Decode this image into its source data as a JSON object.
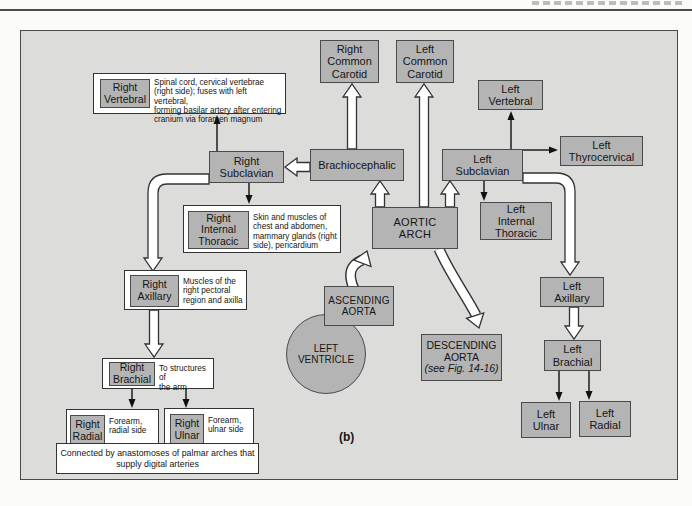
{
  "figure": {
    "caption": "(b)"
  },
  "colors": {
    "box_fill": "#b4b4b4",
    "box_border": "#4a4a4a",
    "frame_background": "#dcdcda",
    "description_box_background": "#ffffff",
    "text": "#151515"
  },
  "nodes": {
    "right_common_carotid": {
      "label": "Right\nCommon\nCarotid"
    },
    "left_common_carotid": {
      "label": "Left\nCommon\nCarotid"
    },
    "left_vertebral": {
      "label": "Left\nVertebral"
    },
    "left_thyrocervical": {
      "label": "Left\nThyrocervical"
    },
    "brachiocephalic": {
      "label": "Brachiocephalic"
    },
    "right_subclavian": {
      "label": "Right\nSubclavian"
    },
    "left_subclavian": {
      "label": "Left\nSubclavian"
    },
    "aortic_arch": {
      "label": "AORTIC\nARCH"
    },
    "left_internal_thoracic": {
      "label": "Left\nInternal\nThoracic"
    },
    "ascending_aorta": {
      "label": "ASCENDING\nAORTA"
    },
    "left_ventricle": {
      "label": "LEFT\nVENTRICLE"
    },
    "descending_aorta": {
      "label": "DESCENDING\nAORTA",
      "sub": "(see Fig. 14-16)"
    },
    "left_axillary": {
      "label": "Left\nAxillary"
    },
    "left_brachial": {
      "label": "Left\nBrachial"
    },
    "left_ulnar": {
      "label": "Left\nUlnar"
    },
    "left_radial": {
      "label": "Left\nRadial"
    }
  },
  "compound": {
    "right_vertebral": {
      "label": "Right\nVertebral",
      "description": "Spinal cord, cervical vertebrae\n(right side); fuses with left vertebral,\nforming basilar artery after entering\ncranium via foramen magnum"
    },
    "right_internal_thoracic": {
      "label": "Right\nInternal\nThoracic",
      "description": "Skin and muscles of\nchest and abdomen,\nmammary glands (right\nside), pericardium"
    },
    "right_axillary": {
      "label": "Right\nAxillary",
      "description": "Muscles of the\nright pectoral\nregion and axilla"
    },
    "right_brachial": {
      "label": "Right\nBrachial",
      "description": "To structures of\nthe arm"
    },
    "right_radial": {
      "label": "Right\nRadial",
      "description": "Forearm,\nradial side"
    },
    "right_ulnar": {
      "label": "Right\nUlnar",
      "description": "Forearm,\nulnar side"
    }
  },
  "note": {
    "text": "Connected by anastomoses of palmar arches that\nsupply digital arteries"
  },
  "edges": [
    {
      "from": "Brachiocephalic",
      "to": "Right Common Carotid",
      "style": "hollow"
    },
    {
      "from": "Aortic Arch",
      "to": "Left Common Carotid",
      "style": "hollow"
    },
    {
      "from": "Aortic Arch",
      "to": "Brachiocephalic",
      "style": "hollow"
    },
    {
      "from": "Aortic Arch",
      "to": "Left Subclavian",
      "style": "hollow"
    },
    {
      "from": "Brachiocephalic",
      "to": "Right Subclavian",
      "style": "hollow"
    },
    {
      "from": "Right Subclavian",
      "to": "Right Vertebral",
      "style": "thin"
    },
    {
      "from": "Right Subclavian",
      "to": "Right Internal Thoracic",
      "style": "thin"
    },
    {
      "from": "Right Subclavian",
      "to": "Right Axillary",
      "style": "hollow-elbow"
    },
    {
      "from": "Left Subclavian",
      "to": "Left Vertebral",
      "style": "thin"
    },
    {
      "from": "Left Subclavian",
      "to": "Left Thyrocervical",
      "style": "thin"
    },
    {
      "from": "Left Subclavian",
      "to": "Left Internal Thoracic",
      "style": "thin"
    },
    {
      "from": "Left Subclavian",
      "to": "Left Axillary",
      "style": "hollow-elbow"
    },
    {
      "from": "Right Axillary",
      "to": "Right Brachial",
      "style": "hollow"
    },
    {
      "from": "Left Axillary",
      "to": "Left Brachial",
      "style": "hollow"
    },
    {
      "from": "Right Brachial",
      "to": "Right Radial",
      "style": "thin"
    },
    {
      "from": "Right Brachial",
      "to": "Right Ulnar",
      "style": "thin"
    },
    {
      "from": "Left Brachial",
      "to": "Left Ulnar",
      "style": "thin"
    },
    {
      "from": "Left Brachial",
      "to": "Left Radial",
      "style": "thin"
    },
    {
      "from": "Ascending Aorta",
      "to": "Aortic Arch",
      "style": "hollow-curved"
    },
    {
      "from": "Aortic Arch",
      "to": "Descending Aorta",
      "style": "hollow-curved"
    }
  ]
}
